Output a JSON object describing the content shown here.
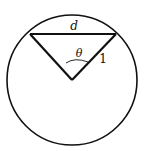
{
  "diagram": {
    "labels": {
      "chord": "d",
      "angle": "θ",
      "radius": "1"
    },
    "geometry": {
      "circle": {
        "cx": 72,
        "cy": 80,
        "r": 65
      },
      "center_vertex": [
        72,
        80
      ],
      "chord_left": [
        30,
        34
      ],
      "chord_right": [
        116,
        34
      ]
    },
    "colors": {
      "stroke": "#111111",
      "background": "#ffffff"
    }
  }
}
